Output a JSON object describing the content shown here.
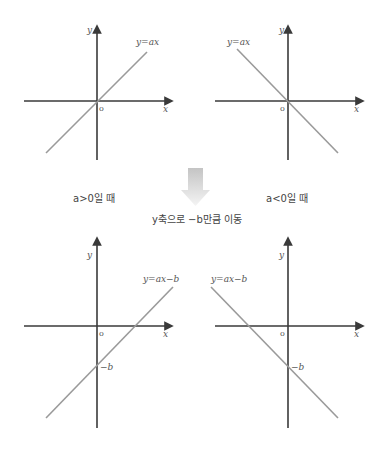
{
  "graphs": [
    {
      "id": "top-left",
      "equation": "y=ax",
      "x_axis_label": "x",
      "y_axis_label": "y",
      "origin_label": "o",
      "slope": "positive",
      "intercept_label": ""
    },
    {
      "id": "top-right",
      "equation": "y=ax",
      "x_axis_label": "x",
      "y_axis_label": "y",
      "origin_label": "o",
      "slope": "negative",
      "intercept_label": ""
    },
    {
      "id": "bottom-left",
      "equation": "y=ax−b",
      "x_axis_label": "x",
      "y_axis_label": "y",
      "origin_label": "o",
      "slope": "positive",
      "intercept_label": "−b"
    },
    {
      "id": "bottom-right",
      "equation": "y=ax−b",
      "x_axis_label": "x",
      "y_axis_label": "y",
      "origin_label": "o",
      "slope": "negative",
      "intercept_label": "−b"
    }
  ],
  "captions": {
    "positive_case": "a>0일 때",
    "negative_case": "a<0일 때",
    "transform": "y축으로 −b만큼 이동"
  },
  "colors": {
    "axis": "#3a3a3a",
    "line": "#9a9a9a",
    "arrow_top": "#c8c8c8",
    "arrow_bottom": "#f2f2f2"
  }
}
